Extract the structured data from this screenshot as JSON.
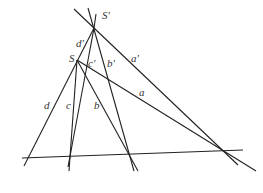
{
  "diagram": {
    "title": "",
    "stroke_color": "#222222",
    "points": {
      "S_prime": {
        "label": "S'",
        "x": 94,
        "y": 28
      },
      "S": {
        "label": "S",
        "x": 77,
        "y": 60
      }
    },
    "lines": [
      {
        "id": "baseline",
        "label": "",
        "x1": 22,
        "y1": 158,
        "x2": 243,
        "y2": 150
      },
      {
        "id": "a_prime",
        "label": "a'",
        "x1": 74,
        "y1": 9,
        "x2": 238,
        "y2": 165
      },
      {
        "id": "a",
        "label": "a",
        "x1": 77,
        "y1": 60,
        "x2": 256,
        "y2": 171
      },
      {
        "id": "d",
        "label": "d",
        "x1": 94,
        "y1": 28,
        "x2": 24,
        "y2": 166
      },
      {
        "id": "d_prime_ext",
        "label": "d'",
        "x1": 96,
        "y1": 14,
        "x2": 94,
        "y2": 28
      },
      {
        "id": "c",
        "label": "c",
        "x1": 77,
        "y1": 60,
        "x2": 69,
        "y2": 171
      },
      {
        "id": "c_prime",
        "label": "c'",
        "x1": 94,
        "y1": 28,
        "x2": 68,
        "y2": 167
      },
      {
        "id": "b",
        "label": "b",
        "x1": 77,
        "y1": 60,
        "x2": 138,
        "y2": 171
      },
      {
        "id": "b_prime",
        "label": "b'",
        "x1": 88,
        "y1": 8,
        "x2": 134,
        "y2": 171
      }
    ],
    "labels": [
      {
        "text": "S'",
        "x": 102,
        "y": 10
      },
      {
        "text": "d'",
        "x": 76,
        "y": 38
      },
      {
        "text": "S",
        "x": 69,
        "y": 53
      },
      {
        "text": "c'",
        "x": 88,
        "y": 58
      },
      {
        "text": "b'",
        "x": 107,
        "y": 58
      },
      {
        "text": "a'",
        "x": 131,
        "y": 53
      },
      {
        "text": "a",
        "x": 139,
        "y": 87
      },
      {
        "text": "d",
        "x": 44,
        "y": 100
      },
      {
        "text": "c",
        "x": 66,
        "y": 100
      },
      {
        "text": "b",
        "x": 94,
        "y": 100
      }
    ]
  }
}
